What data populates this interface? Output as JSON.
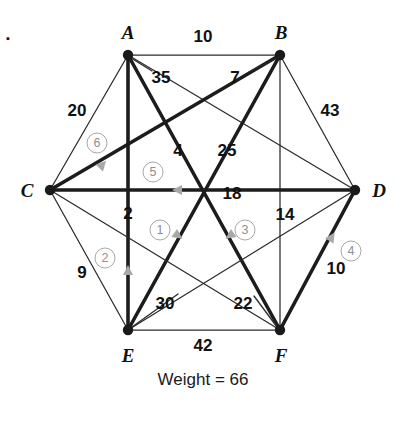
{
  "figure": {
    "corner_mark": ".",
    "total_text": "Weight = 66"
  },
  "vertices": [
    {
      "id": "A",
      "label": "A",
      "x": 128,
      "y": 55,
      "label_x": 128,
      "label_y": 32
    },
    {
      "id": "B",
      "label": "B",
      "x": 280,
      "y": 55,
      "label_x": 281,
      "label_y": 32
    },
    {
      "id": "C",
      "label": "C",
      "x": 50,
      "y": 190,
      "label_x": 27,
      "label_y": 190
    },
    {
      "id": "D",
      "label": "D",
      "x": 355,
      "y": 190,
      "label_x": 379,
      "label_y": 190
    },
    {
      "id": "E",
      "label": "E",
      "x": 128,
      "y": 330,
      "label_x": 128,
      "label_y": 355
    },
    {
      "id": "F",
      "label": "F",
      "x": 280,
      "y": 330,
      "label_x": 281,
      "label_y": 355
    }
  ],
  "edges": [
    {
      "from": "A",
      "to": "B",
      "weight": "10",
      "selected": false,
      "label_x": 203,
      "label_y": 36
    },
    {
      "from": "A",
      "to": "C",
      "weight": "20",
      "selected": false,
      "label_x": 77,
      "label_y": 110
    },
    {
      "from": "A",
      "to": "D",
      "weight": "35",
      "selected": false,
      "label_x": 161,
      "label_y": 77
    },
    {
      "from": "A",
      "to": "E",
      "weight": "2",
      "selected": true,
      "label_x": 128,
      "label_y": 213
    },
    {
      "from": "A",
      "to": "F",
      "weight": "4",
      "selected": true,
      "label_x": 178,
      "label_y": 150
    },
    {
      "from": "B",
      "to": "C",
      "weight": "7",
      "selected": true,
      "label_x": 235,
      "label_y": 77
    },
    {
      "from": "B",
      "to": "D",
      "weight": "43",
      "selected": false,
      "label_x": 330,
      "label_y": 110
    },
    {
      "from": "B",
      "to": "E",
      "weight": "25",
      "selected": true,
      "label_x": 227,
      "label_y": 150
    },
    {
      "from": "B",
      "to": "F",
      "weight": "14",
      "selected": false,
      "label_x": 285,
      "label_y": 214
    },
    {
      "from": "C",
      "to": "D",
      "weight": "18",
      "selected": true,
      "label_x": 232,
      "label_y": 193
    },
    {
      "from": "C",
      "to": "E",
      "weight": "9",
      "selected": false,
      "label_x": 82,
      "label_y": 272
    },
    {
      "from": "C",
      "to": "F",
      "weight": "22",
      "selected": false,
      "label_x": 243,
      "label_y": 303
    },
    {
      "from": "D",
      "to": "E",
      "weight": "30",
      "selected": false,
      "label_x": 165,
      "label_y": 303
    },
    {
      "from": "D",
      "to": "F",
      "weight": "10",
      "selected": true,
      "label_x": 336,
      "label_y": 268
    },
    {
      "from": "E",
      "to": "F",
      "weight": "42",
      "selected": false,
      "label_x": 203,
      "label_y": 345
    }
  ],
  "leaders": [
    {
      "name": "leader-35",
      "x1": 152,
      "y1": 71,
      "x2": 131,
      "y2": 58
    },
    {
      "name": "leader-7",
      "x1": 249,
      "y1": 72,
      "x2": 277,
      "y2": 58
    },
    {
      "name": "leader-30",
      "x1": 178,
      "y1": 294,
      "x2": 132,
      "y2": 327
    },
    {
      "name": "leader-22",
      "x1": 254,
      "y1": 296,
      "x2": 277,
      "y2": 327
    }
  ],
  "order_marks": [
    {
      "n": "1",
      "x": 160,
      "y": 230
    },
    {
      "n": "2",
      "x": 105,
      "y": 258
    },
    {
      "n": "3",
      "x": 245,
      "y": 230
    },
    {
      "n": "4",
      "x": 351,
      "y": 251
    },
    {
      "n": "5",
      "x": 153,
      "y": 172
    },
    {
      "n": "6",
      "x": 97,
      "y": 143
    }
  ],
  "direction_arrows": [
    {
      "name": "arrow-step-1",
      "x": 180,
      "y": 237,
      "angle": 35
    },
    {
      "name": "arrow-step-2",
      "x": 128,
      "y": 268,
      "angle": -90
    },
    {
      "name": "arrow-step-3",
      "x": 228,
      "y": 237,
      "angle": 145
    },
    {
      "name": "arrow-step-4",
      "x": 333,
      "y": 235,
      "angle": -58
    },
    {
      "name": "arrow-step-5",
      "x": 175,
      "y": 190,
      "angle": 180
    },
    {
      "name": "arrow-step-6",
      "x": 104,
      "y": 163,
      "angle": -48
    }
  ],
  "colors": {
    "ink": "#1a1a1a",
    "thin_edge": "#2b2b2b",
    "thick_edge": "#1c1c1c",
    "order_gray": "#a8a8a8",
    "background": "#ffffff"
  }
}
